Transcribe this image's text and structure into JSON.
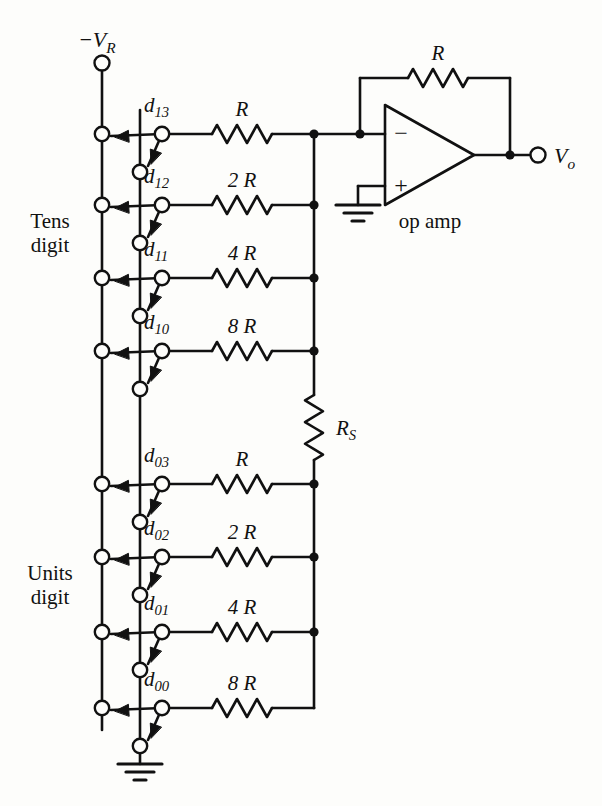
{
  "figure": {
    "type": "circuit-schematic"
  },
  "terminals": {
    "reference_label": "−V",
    "reference_sub": "R",
    "output_label": "V",
    "output_sub": "o"
  },
  "groups": [
    {
      "name": "tens",
      "line1": "Tens",
      "line2": "digit"
    },
    {
      "name": "units",
      "line1": "Units",
      "line2": "digit"
    }
  ],
  "op_amp": {
    "label": "op amp",
    "inverting_sign": "−",
    "noninverting_sign": "+",
    "feedback_resistor": "R"
  },
  "scaling_resistor": {
    "label": "R",
    "sub": "S"
  },
  "switch_rows": [
    {
      "switch_label": "d",
      "switch_sub": "13",
      "resistor": "R",
      "group": "tens",
      "y": 134
    },
    {
      "switch_label": "d",
      "switch_sub": "12",
      "resistor": "2 R",
      "group": "tens",
      "y": 205
    },
    {
      "switch_label": "d",
      "switch_sub": "11",
      "resistor": "4 R",
      "group": "tens",
      "y": 278
    },
    {
      "switch_label": "d",
      "switch_sub": "10",
      "resistor": "8 R",
      "group": "tens",
      "y": 351
    },
    {
      "switch_label": "d",
      "switch_sub": "03",
      "resistor": "R",
      "group": "units",
      "y": 484
    },
    {
      "switch_label": "d",
      "switch_sub": "02",
      "resistor": "2 R",
      "group": "units",
      "y": 557
    },
    {
      "switch_label": "d",
      "switch_sub": "01",
      "resistor": "4 R",
      "group": "units",
      "y": 632
    },
    {
      "switch_label": "d",
      "switch_sub": "00",
      "resistor": "8 R",
      "group": "units",
      "y": 708
    }
  ],
  "colors": {
    "ink": "#111111",
    "paper": "#fdfdfb"
  }
}
